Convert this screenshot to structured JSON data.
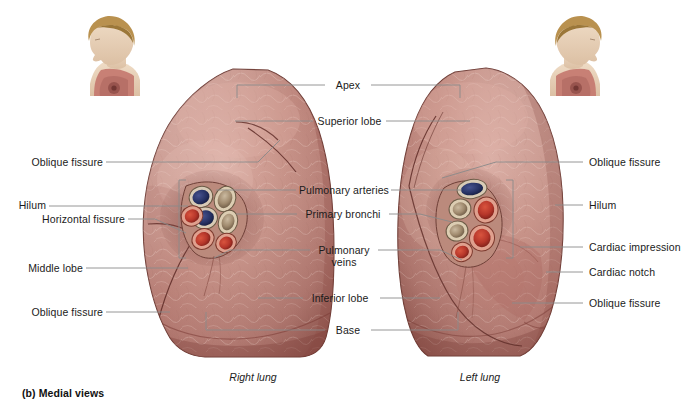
{
  "figure": {
    "caption": "(b) Medial views",
    "background_color": "#ffffff",
    "label_color": "#1b1b1b",
    "leader_color": "#8a8a8a"
  },
  "view_names": {
    "right": "Right lung",
    "left": "Left lung"
  },
  "labels_left": [
    {
      "text": "Oblique fissure",
      "name": "label-oblique-fissure-superior-right-lung"
    },
    {
      "text": "Hilum",
      "name": "label-hilum-right-lung"
    },
    {
      "text": "Horizontal fissure",
      "name": "label-horizontal-fissure-right-lung"
    },
    {
      "text": "Middle lobe",
      "name": "label-middle-lobe-right-lung"
    },
    {
      "text": "Oblique fissure",
      "name": "label-oblique-fissure-inferior-right-lung"
    }
  ],
  "labels_center": [
    {
      "text": "Apex",
      "name": "label-apex"
    },
    {
      "text": "Superior lobe",
      "name": "label-superior-lobe"
    },
    {
      "text": "Pulmonary arteries",
      "name": "label-pulmonary-arteries"
    },
    {
      "text": "Primary bronchi",
      "name": "label-primary-bronchi"
    },
    {
      "text": "Pulmonary",
      "name": "label-pulmonary-veins-line1"
    },
    {
      "text": "veins",
      "name": "label-pulmonary-veins-line2"
    },
    {
      "text": "Inferior lobe",
      "name": "label-inferior-lobe"
    },
    {
      "text": "Base",
      "name": "label-base"
    }
  ],
  "labels_right": [
    {
      "text": "Oblique fissure",
      "name": "label-oblique-fissure-superior-left-lung"
    },
    {
      "text": "Hilum",
      "name": "label-hilum-left-lung"
    },
    {
      "text": "Cardiac impression",
      "name": "label-cardiac-impression"
    },
    {
      "text": "Cardiac notch",
      "name": "label-cardiac-notch"
    },
    {
      "text": "Oblique fissure",
      "name": "label-oblique-fissure-inferior-left-lung"
    }
  ],
  "structures": {
    "lung_tissue_color": "#b9756c",
    "lung_tissue_shadow": "#8d4d47",
    "lung_tissue_highlight": "#d7a79c",
    "pulmonary_artery_color": "#2b3566",
    "primary_bronchus_color": "#b9a388",
    "pulmonary_vein_color": "#b8372a",
    "inset_skin_color": "#e3cbb4",
    "inset_hair_color": "#b9914f",
    "inset_lung_color": "#c4786f"
  }
}
